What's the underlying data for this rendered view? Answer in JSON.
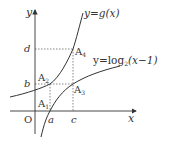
{
  "diagram": {
    "type": "function-graph",
    "axes": {
      "x_label": "x",
      "y_label": "y",
      "origin_label": "O"
    },
    "curves": [
      {
        "id": "g",
        "label_prefix": "y=",
        "label_func": "g(x)"
      },
      {
        "id": "log",
        "label_prefix": "y=log",
        "label_base": "2",
        "label_arg": "(x−1)"
      }
    ],
    "points": [
      {
        "id": "A1",
        "letter": "A",
        "sub": "1"
      },
      {
        "id": "A2",
        "letter": "A",
        "sub": "2"
      },
      {
        "id": "A3",
        "letter": "A",
        "sub": "3"
      },
      {
        "id": "A4",
        "letter": "A",
        "sub": "4"
      }
    ],
    "x_ticks": [
      "a",
      "c"
    ],
    "y_ticks": [
      "b",
      "d"
    ],
    "colors": {
      "curve": "#333333",
      "axis": "#333333",
      "guide": "#555555"
    }
  }
}
